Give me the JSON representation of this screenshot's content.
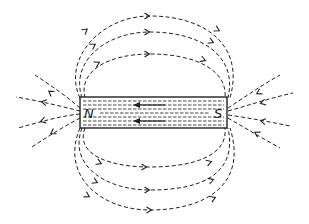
{
  "diagram": {
    "title": "",
    "type": "bar-magnet-field-lines",
    "magnet": {
      "north_label": "N",
      "south_label": "S",
      "internal_field_direction": "south-to-north"
    },
    "external_field_direction": "north-to-south",
    "colors": {
      "line": "#222222",
      "background": "#ffffff"
    }
  }
}
